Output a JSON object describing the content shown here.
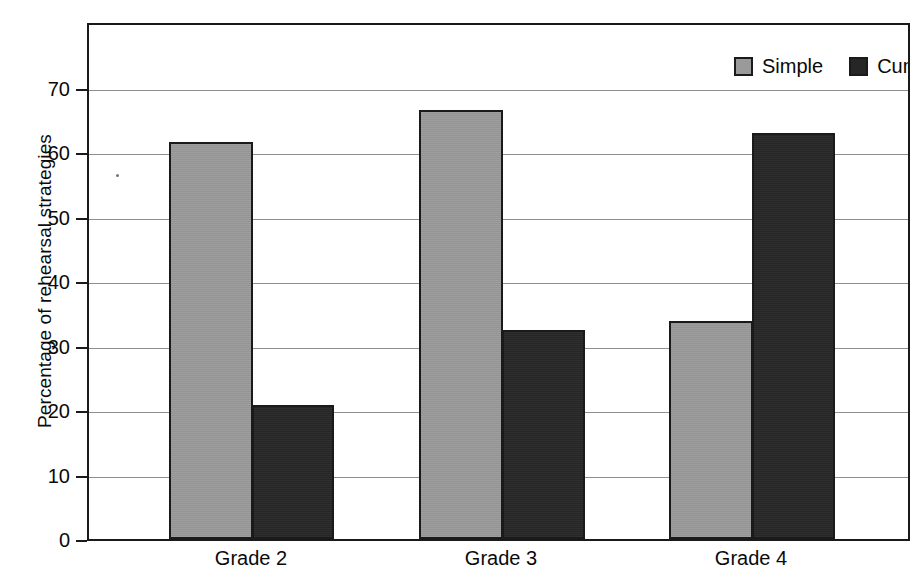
{
  "chart_data": {
    "type": "bar",
    "title": "",
    "xlabel": "",
    "ylabel": "Percentage of rehearsal strategies",
    "categories": [
      "Grade 2",
      "Grade 3",
      "Grade 4"
    ],
    "series": [
      {
        "name": "Simple",
        "color": "#9a9a9a",
        "values": [
          61.5,
          66.5,
          33.8
        ]
      },
      {
        "name": "Cumulative",
        "color": "#262626",
        "values": [
          20.8,
          32.4,
          63.0
        ]
      }
    ],
    "ylim": [
      0,
      80.3
    ],
    "yticks": [
      0,
      10,
      20,
      30,
      40,
      50,
      60,
      70
    ],
    "ytick_labels": [
      "0",
      "10",
      "20",
      "30",
      "40",
      "50",
      "60",
      "70"
    ],
    "grid": true,
    "legend_position": "top-right"
  },
  "axes": {
    "y_title": "Percentage of rehearsal strategies",
    "ticks": [
      {
        "value": 70,
        "label": "70"
      },
      {
        "value": 60,
        "label": "60"
      },
      {
        "value": 50,
        "label": "50"
      },
      {
        "value": 40,
        "label": "40"
      },
      {
        "value": 30,
        "label": "30"
      },
      {
        "value": 20,
        "label": "20"
      },
      {
        "value": 10,
        "label": "10"
      },
      {
        "value": 0,
        "label": "0"
      }
    ],
    "x_groups": [
      {
        "label": "Grade 2"
      },
      {
        "label": "Grade 3"
      },
      {
        "label": "Grade 4"
      }
    ]
  },
  "legend": {
    "items": [
      {
        "label": "Simple",
        "color": "#9a9a9a"
      },
      {
        "label": "Cumulative",
        "color": "#262626"
      }
    ]
  },
  "bars": [
    {
      "group": "Grade 2",
      "series": "Simple",
      "value": 61.5
    },
    {
      "group": "Grade 2",
      "series": "Cumulative",
      "value": 20.8
    },
    {
      "group": "Grade 3",
      "series": "Simple",
      "value": 66.5
    },
    {
      "group": "Grade 3",
      "series": "Cumulative",
      "value": 32.4
    },
    {
      "group": "Grade 4",
      "series": "Simple",
      "value": 33.8
    },
    {
      "group": "Grade 4",
      "series": "Cumulative",
      "value": 63.0
    }
  ]
}
